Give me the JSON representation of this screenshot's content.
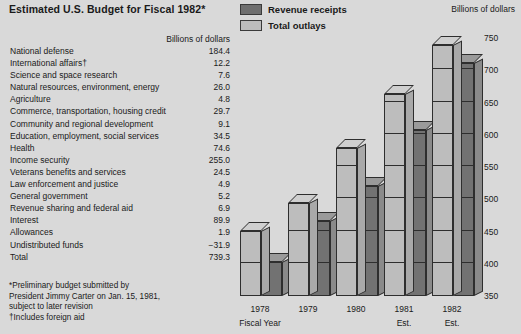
{
  "title": "Estimated U.S. Budget for Fiscal 1982*",
  "legend": {
    "items": [
      {
        "label": "Revenue receipts",
        "swatch": "dark",
        "color": "#6f6f6f"
      },
      {
        "label": "Total outlays",
        "swatch": "light",
        "color": "#bcbcbc"
      }
    ]
  },
  "table": {
    "header": "Billions of dollars",
    "rows": [
      {
        "label": "National defense",
        "value": "184.4"
      },
      {
        "label": "International affairs†",
        "value": "12.2"
      },
      {
        "label": "Science and space research",
        "value": "7.6"
      },
      {
        "label": "Natural resources, environment, energy",
        "value": "26.0"
      },
      {
        "label": "Agriculture",
        "value": "4.8"
      },
      {
        "label": "Commerce, transportation, housing credit",
        "value": "29.7"
      },
      {
        "label": "Community and regional development",
        "value": "9.1"
      },
      {
        "label": "Education, employment, social services",
        "value": "34.5"
      },
      {
        "label": "Health",
        "value": "74.6"
      },
      {
        "label": "Income security",
        "value": "255.0"
      },
      {
        "label": "Veterans benefits and services",
        "value": "24.5"
      },
      {
        "label": "Law enforcement and justice",
        "value": "4.9"
      },
      {
        "label": "General government",
        "value": "5.2"
      },
      {
        "label": "Revenue sharing and federal aid",
        "value": "6.9"
      },
      {
        "label": "Interest",
        "value": "89.9"
      },
      {
        "label": "Allowances",
        "value": "1.9"
      },
      {
        "label": "Undistributed funds",
        "value": "−31.9"
      },
      {
        "label": "Total",
        "value": "739.3"
      }
    ]
  },
  "notes": [
    "*Preliminary budget submitted by",
    "President Jimmy Carter on Jan. 15, 1981,",
    "subject to later revision",
    "†Includes foreign aid"
  ],
  "chart_data": {
    "type": "bar",
    "title": "Estimated U.S. Budget for Fiscal 1982",
    "units_label": "Billions of dollars",
    "xlabel": "Fiscal Year",
    "ylabel": "Billions of dollars",
    "ylim": [
      350,
      750
    ],
    "yticks": [
      350,
      400,
      450,
      500,
      550,
      600,
      650,
      700,
      750
    ],
    "ytick_labels": [
      "350",
      "400",
      "450",
      "500",
      "550",
      "600",
      "650",
      "700",
      "750"
    ],
    "grid": true,
    "legend_position": "top-center",
    "categories": [
      "1978",
      "1979",
      "1980",
      "1981",
      "1982"
    ],
    "category_sublabels": [
      "Fiscal Year",
      "",
      "",
      "Est.",
      "Est."
    ],
    "series": [
      {
        "name": "Revenue receipts",
        "color": "#6f6f6f",
        "values": [
          402,
          466,
          520,
          608,
          711
        ]
      },
      {
        "name": "Total outlays",
        "color": "#bcbcbc",
        "values": [
          451,
          494,
          580,
          663,
          739
        ]
      }
    ]
  }
}
